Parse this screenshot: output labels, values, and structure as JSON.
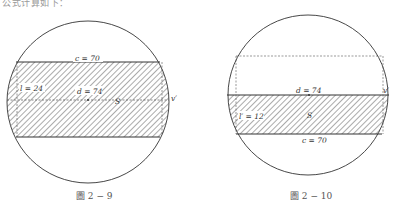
{
  "top_text": "公式计算如下：",
  "figures": [
    {
      "id": "fig-2-9",
      "caption": "圖 2 − 9",
      "labels": {
        "c": "c = 70",
        "l": "l = 24",
        "d": "d = 74",
        "S": "S",
        "v": "v′"
      },
      "values": {
        "c": 70,
        "l": 24,
        "d": 74
      }
    },
    {
      "id": "fig-2-10",
      "caption": "圖 2 − 10",
      "labels": {
        "d": "d = 74",
        "l": "l′ = 12",
        "S": "S",
        "c": "c = 70",
        "v": "v′"
      },
      "values": {
        "d": 74,
        "l": 12,
        "c": 70
      }
    }
  ],
  "colors": {
    "line": "#333333",
    "hatch": "#444444",
    "dashed": "#555555"
  }
}
